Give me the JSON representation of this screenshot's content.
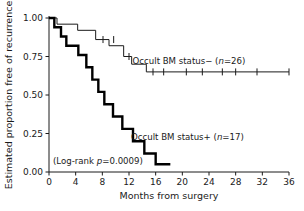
{
  "chart_data": {
    "type": "line",
    "title": "",
    "xlabel": "Months from surgery",
    "ylabel": "Estimated proportion free of recurrence",
    "xlim": [
      0,
      36
    ],
    "ylim": [
      0,
      1.0
    ],
    "xticks": [
      0,
      4,
      8,
      12,
      16,
      20,
      24,
      28,
      32,
      36
    ],
    "xticklabels": [
      "0",
      "4",
      "8",
      "12",
      "16",
      "20",
      "24",
      "28",
      "32",
      "36"
    ],
    "yticks": [
      0.0,
      0.25,
      0.5,
      0.75,
      1.0
    ],
    "yticklabels": [
      "0.00",
      "0.25",
      "0.50",
      "0.75",
      "1.00"
    ],
    "grid": false,
    "legend_position": "inline-annotation",
    "series": [
      {
        "name": "Occult BM status− (n=26)",
        "label": "Occult BM status−",
        "n": 26,
        "style": "thin",
        "color": "#1a1a1a",
        "steps": [
          {
            "t": 0.0,
            "s": 1.0
          },
          {
            "t": 1.2,
            "s": 1.0
          },
          {
            "t": 1.2,
            "s": 0.96
          },
          {
            "t": 4.3,
            "s": 0.96
          },
          {
            "t": 4.3,
            "s": 0.92
          },
          {
            "t": 7.0,
            "s": 0.92
          },
          {
            "t": 7.0,
            "s": 0.86
          },
          {
            "t": 9.0,
            "s": 0.86
          },
          {
            "t": 9.0,
            "s": 0.82
          },
          {
            "t": 11.2,
            "s": 0.82
          },
          {
            "t": 11.2,
            "s": 0.75
          },
          {
            "t": 12.4,
            "s": 0.75
          },
          {
            "t": 12.4,
            "s": 0.7
          },
          {
            "t": 14.6,
            "s": 0.7
          },
          {
            "t": 14.6,
            "s": 0.65
          },
          {
            "t": 36.0,
            "s": 0.65
          }
        ],
        "censored": [
          {
            "t": 8.1,
            "s": 0.86
          },
          {
            "t": 9.7,
            "s": 0.86
          },
          {
            "t": 12.0,
            "s": 0.75
          },
          {
            "t": 15.6,
            "s": 0.65
          },
          {
            "t": 17.2,
            "s": 0.65
          },
          {
            "t": 20.6,
            "s": 0.65
          },
          {
            "t": 23.0,
            "s": 0.65
          },
          {
            "t": 26.0,
            "s": 0.65
          },
          {
            "t": 28.0,
            "s": 0.65
          },
          {
            "t": 31.2,
            "s": 0.65
          },
          {
            "t": 36.0,
            "s": 0.65
          }
        ]
      },
      {
        "name": "Occult BM status+ (n=17)",
        "label": "Occult BM status+",
        "n": 17,
        "style": "bold",
        "color": "#000000",
        "steps": [
          {
            "t": 0.0,
            "s": 1.0
          },
          {
            "t": 0.8,
            "s": 1.0
          },
          {
            "t": 0.8,
            "s": 0.94
          },
          {
            "t": 1.8,
            "s": 0.94
          },
          {
            "t": 1.8,
            "s": 0.88
          },
          {
            "t": 2.6,
            "s": 0.88
          },
          {
            "t": 2.6,
            "s": 0.82
          },
          {
            "t": 4.4,
            "s": 0.82
          },
          {
            "t": 4.4,
            "s": 0.76
          },
          {
            "t": 5.6,
            "s": 0.76
          },
          {
            "t": 5.6,
            "s": 0.68
          },
          {
            "t": 6.5,
            "s": 0.68
          },
          {
            "t": 6.5,
            "s": 0.6
          },
          {
            "t": 7.4,
            "s": 0.6
          },
          {
            "t": 7.4,
            "s": 0.52
          },
          {
            "t": 8.3,
            "s": 0.52
          },
          {
            "t": 8.3,
            "s": 0.44
          },
          {
            "t": 9.6,
            "s": 0.44
          },
          {
            "t": 9.6,
            "s": 0.36
          },
          {
            "t": 11.0,
            "s": 0.36
          },
          {
            "t": 11.0,
            "s": 0.28
          },
          {
            "t": 12.6,
            "s": 0.28
          },
          {
            "t": 12.6,
            "s": 0.2
          },
          {
            "t": 14.3,
            "s": 0.2
          },
          {
            "t": 14.3,
            "s": 0.12
          },
          {
            "t": 16.0,
            "s": 0.12
          },
          {
            "t": 16.0,
            "s": 0.05
          },
          {
            "t": 18.2,
            "s": 0.05
          }
        ],
        "censored": []
      }
    ],
    "annotations": [
      {
        "id": "label-neg",
        "text": "Occult BM status− (n=26)",
        "t": 21.0,
        "s": 0.7
      },
      {
        "id": "label-pos",
        "text": "Occult BM status+ (n=17)",
        "t": 12.3,
        "s": 0.205
      },
      {
        "id": "logrank",
        "text": "(Log-rank p=0.0009)",
        "t": 0.6,
        "s": 0.055
      }
    ]
  },
  "annotations": {
    "label_neg_prefix": "Occult BM status− (",
    "label_neg_n": "n",
    "label_neg_suffix": "=26)",
    "label_pos_prefix": "Occult BM status+ (",
    "label_pos_n": "n",
    "label_pos_suffix": "=17)",
    "logrank_prefix": "(Log-rank ",
    "logrank_p": "p",
    "logrank_suffix": "=0.0009)"
  },
  "axes": {
    "xlabel": "Months from surgery",
    "ylabel": "Estimated proportion free of recurrence",
    "xticklabels": [
      "0",
      "4",
      "8",
      "12",
      "16",
      "20",
      "24",
      "28",
      "32",
      "36"
    ],
    "yticklabels": [
      "0.00",
      "0.25",
      "0.50",
      "0.75",
      "1.00"
    ]
  },
  "colors": {
    "axis": "#1a1a1a",
    "curve_thin": "#1a1a1a",
    "curve_bold": "#000000",
    "background": "#ffffff"
  }
}
